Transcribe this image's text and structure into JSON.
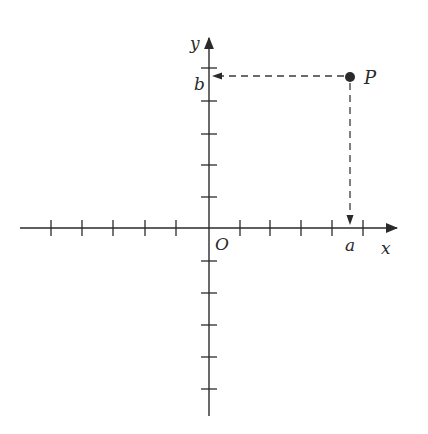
{
  "figure": {
    "origin_px": [
      209,
      228
    ],
    "x_axis": {
      "label": "x",
      "start_px": 20,
      "end_px": 398,
      "tick_positions_px": [
        51,
        82,
        113,
        145,
        176,
        240,
        270,
        301,
        332,
        363
      ]
    },
    "y_axis": {
      "label": "y",
      "top_px": 37,
      "bottom_px": 416,
      "tick_positions_px": [
        68,
        101,
        134,
        165,
        197,
        261,
        293,
        325,
        357,
        389
      ]
    },
    "origin_label": "O",
    "point": {
      "label": "P",
      "px": [
        350,
        77
      ],
      "x_coordinate_label": "a",
      "y_coordinate_label": "b"
    }
  }
}
